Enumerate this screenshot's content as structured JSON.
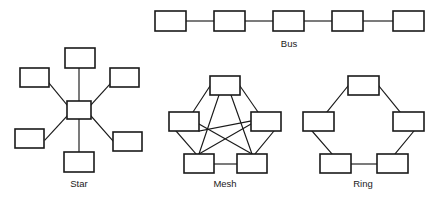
{
  "figure": {
    "background_color": "#ffffff",
    "node_fill": "#ffffff",
    "node_stroke": "#1a1a1a",
    "line_color": "#1a1a1a"
  },
  "topologies": [
    {
      "id": "bus",
      "label": "Bus",
      "label_x": 289,
      "label_y": 47,
      "node_count": 5,
      "link_count": 4,
      "nodes": [
        {
          "name": "bus-node-1",
          "x": 155,
          "y": 11,
          "w": 31,
          "h": 20
        },
        {
          "name": "bus-node-2",
          "x": 214,
          "y": 11,
          "w": 31,
          "h": 20
        },
        {
          "name": "bus-node-3",
          "x": 273,
          "y": 11,
          "w": 31,
          "h": 20
        },
        {
          "name": "bus-node-4",
          "x": 332,
          "y": 11,
          "w": 31,
          "h": 20
        },
        {
          "name": "bus-node-5",
          "x": 393,
          "y": 11,
          "w": 31,
          "h": 20
        }
      ],
      "links": [
        {
          "x1": 186,
          "y1": 21,
          "x2": 214,
          "y2": 21
        },
        {
          "x1": 245,
          "y1": 21,
          "x2": 273,
          "y2": 21
        },
        {
          "x1": 304,
          "y1": 21,
          "x2": 332,
          "y2": 21
        },
        {
          "x1": 363,
          "y1": 21,
          "x2": 393,
          "y2": 21
        }
      ]
    },
    {
      "id": "star",
      "label": "Star",
      "label_x": 79,
      "label_y": 187,
      "node_count": 7,
      "link_count": 6,
      "nodes": [
        {
          "name": "star-hub",
          "x": 67,
          "y": 101,
          "w": 24,
          "h": 18
        },
        {
          "name": "star-node-top",
          "x": 65,
          "y": 48,
          "w": 30,
          "h": 20
        },
        {
          "name": "star-node-upper-left",
          "x": 20,
          "y": 68,
          "w": 29,
          "h": 19
        },
        {
          "name": "star-node-upper-right",
          "x": 110,
          "y": 68,
          "w": 29,
          "h": 19
        },
        {
          "name": "star-node-lower-left",
          "x": 15,
          "y": 129,
          "w": 29,
          "h": 19
        },
        {
          "name": "star-node-lower-right",
          "x": 113,
          "y": 132,
          "w": 29,
          "h": 19
        },
        {
          "name": "star-node-bottom",
          "x": 64,
          "y": 152,
          "w": 30,
          "h": 20
        }
      ],
      "links": [
        {
          "x1": 79,
          "y1": 101,
          "x2": 79,
          "y2": 68
        },
        {
          "x1": 67,
          "y1": 105,
          "x2": 49,
          "y2": 83
        },
        {
          "x1": 91,
          "y1": 105,
          "x2": 110,
          "y2": 84
        },
        {
          "x1": 67,
          "y1": 116,
          "x2": 45,
          "y2": 140
        },
        {
          "x1": 91,
          "y1": 116,
          "x2": 113,
          "y2": 141
        },
        {
          "x1": 79,
          "y1": 119,
          "x2": 79,
          "y2": 152
        }
      ]
    },
    {
      "id": "mesh",
      "label": "Mesh",
      "label_x": 225,
      "label_y": 187,
      "node_count": 5,
      "link_count": 10,
      "nodes": [
        {
          "name": "mesh-node-top",
          "x": 210,
          "y": 76,
          "w": 30,
          "h": 19
        },
        {
          "name": "mesh-node-left",
          "x": 169,
          "y": 112,
          "w": 30,
          "h": 19
        },
        {
          "name": "mesh-node-right",
          "x": 251,
          "y": 112,
          "w": 30,
          "h": 19
        },
        {
          "name": "mesh-node-bottom-left",
          "x": 184,
          "y": 154,
          "w": 30,
          "h": 19
        },
        {
          "name": "mesh-node-bottom-right",
          "x": 237,
          "y": 154,
          "w": 30,
          "h": 19
        }
      ],
      "links": [
        {
          "x1": 210,
          "y1": 86,
          "x2": 193,
          "y2": 112
        },
        {
          "x1": 240,
          "y1": 86,
          "x2": 258,
          "y2": 112
        },
        {
          "x1": 219,
          "y1": 95,
          "x2": 199,
          "y2": 154
        },
        {
          "x1": 231,
          "y1": 95,
          "x2": 252,
          "y2": 154
        },
        {
          "x1": 199,
          "y1": 131,
          "x2": 251,
          "y2": 121
        },
        {
          "x1": 199,
          "y1": 124,
          "x2": 252,
          "y2": 154
        },
        {
          "x1": 251,
          "y1": 124,
          "x2": 199,
          "y2": 154
        },
        {
          "x1": 176,
          "y1": 131,
          "x2": 196,
          "y2": 154
        },
        {
          "x1": 274,
          "y1": 131,
          "x2": 255,
          "y2": 154
        },
        {
          "x1": 214,
          "y1": 164,
          "x2": 237,
          "y2": 164
        }
      ]
    },
    {
      "id": "ring",
      "label": "Ring",
      "label_x": 363,
      "label_y": 187,
      "node_count": 5,
      "link_count": 5,
      "nodes": [
        {
          "name": "ring-node-top",
          "x": 348,
          "y": 76,
          "w": 31,
          "h": 19
        },
        {
          "name": "ring-node-left",
          "x": 303,
          "y": 112,
          "w": 31,
          "h": 19
        },
        {
          "name": "ring-node-right",
          "x": 393,
          "y": 112,
          "w": 31,
          "h": 19
        },
        {
          "name": "ring-node-bottom-left",
          "x": 320,
          "y": 154,
          "w": 31,
          "h": 19
        },
        {
          "name": "ring-node-bottom-right",
          "x": 377,
          "y": 154,
          "w": 31,
          "h": 19
        }
      ],
      "links": [
        {
          "x1": 348,
          "y1": 86,
          "x2": 327,
          "y2": 112
        },
        {
          "x1": 379,
          "y1": 86,
          "x2": 400,
          "y2": 112
        },
        {
          "x1": 312,
          "y1": 131,
          "x2": 332,
          "y2": 154
        },
        {
          "x1": 414,
          "y1": 131,
          "x2": 395,
          "y2": 154
        },
        {
          "x1": 351,
          "y1": 164,
          "x2": 377,
          "y2": 164
        }
      ]
    }
  ]
}
